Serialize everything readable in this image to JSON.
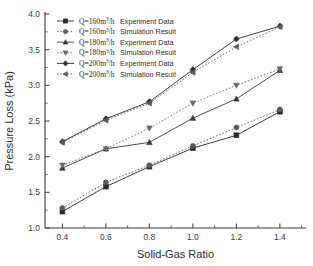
{
  "chart_data": {
    "type": "line",
    "title": "",
    "xlabel": "Solid-Gas Ratio",
    "ylabel": "Pressure Loss (kPa)",
    "xlim": [
      0.32,
      1.52
    ],
    "ylim": [
      1.0,
      4.0
    ],
    "xticks": [
      "0.4",
      "0.6",
      "0.8",
      "1.0",
      "1.2",
      "1.4"
    ],
    "xtick_values": [
      0.4,
      0.6,
      0.8,
      1.0,
      1.2,
      1.4
    ],
    "yticks": [
      "1.0",
      "1.5",
      "2.0",
      "2.5",
      "3.0",
      "3.5",
      "4.0"
    ],
    "ytick_values": [
      1.0,
      1.5,
      2.0,
      2.5,
      3.0,
      3.5,
      4.0
    ],
    "grid": false,
    "legend_position": "top-left",
    "x": [
      0.4,
      0.6,
      0.8,
      1.0,
      1.2,
      1.4
    ],
    "series": [
      {
        "name": "Q=160m3/h  Experiment Data",
        "flow": "160",
        "kind": "Experiment Data",
        "marker": "square",
        "linestyle": "solid",
        "color": "#2a2a2a",
        "values": [
          1.23,
          1.58,
          1.86,
          2.12,
          2.3,
          2.63
        ]
      },
      {
        "name": "Q=160m3/h  Simulation Result",
        "flow": "160",
        "kind": "Simulation Result",
        "marker": "circle",
        "linestyle": "dotted",
        "color": "#5a5a5a",
        "values": [
          1.28,
          1.64,
          1.88,
          2.15,
          2.41,
          2.66
        ]
      },
      {
        "name": "Q=180m3/h  Experiment Data",
        "flow": "180",
        "kind": "Experiment Data",
        "marker": "triangle-up",
        "linestyle": "solid",
        "color": "#3a3a3a",
        "values": [
          1.84,
          2.11,
          2.2,
          2.54,
          2.81,
          3.21
        ]
      },
      {
        "name": "Q=180m3/h  Simulation Result",
        "flow": "180",
        "kind": "Simulation Result",
        "marker": "triangle-down",
        "linestyle": "dotted",
        "color": "#6a6a6a",
        "values": [
          1.88,
          2.11,
          2.4,
          2.75,
          3.0,
          3.23
        ]
      },
      {
        "name": "Q=200m3/h  Experiment Data",
        "flow": "200",
        "kind": "Experiment Data",
        "marker": "diamond",
        "linestyle": "solid",
        "color": "#2a2a2a",
        "values": [
          2.21,
          2.53,
          2.77,
          3.22,
          3.65,
          3.83
        ]
      },
      {
        "name": "Q=200m3/h  Simulation Result",
        "flow": "200",
        "kind": "Simulation Result",
        "marker": "triangle-left",
        "linestyle": "dotted",
        "color": "#5a5a5a",
        "values": [
          2.2,
          2.51,
          2.75,
          3.18,
          3.54,
          3.82
        ]
      }
    ]
  },
  "legend": {
    "rows": [
      {
        "q_prefix": "Q=160m",
        "q_sup": "3",
        "q_suffix": "/h",
        "label": "Experiment Data"
      },
      {
        "q_prefix": "Q=160m",
        "q_sup": "3",
        "q_suffix": "/h",
        "label": "Simulation Result"
      },
      {
        "q_prefix": "Q=180m",
        "q_sup": "3",
        "q_suffix": "/h",
        "label": "Experiment Data"
      },
      {
        "q_prefix": "Q=180m",
        "q_sup": "3",
        "q_suffix": "/h",
        "label": "Simulation Result"
      },
      {
        "q_prefix": "Q=200m",
        "q_sup": "3",
        "q_suffix": "/h",
        "label": "Experiment Data"
      },
      {
        "q_prefix": "Q=200m",
        "q_sup": "3",
        "q_suffix": "/h",
        "label": "Simulation Result"
      }
    ]
  },
  "axes": {
    "x_title": "Solid-Gas Ratio",
    "y_title": "Pressure Loss (kPa)"
  }
}
